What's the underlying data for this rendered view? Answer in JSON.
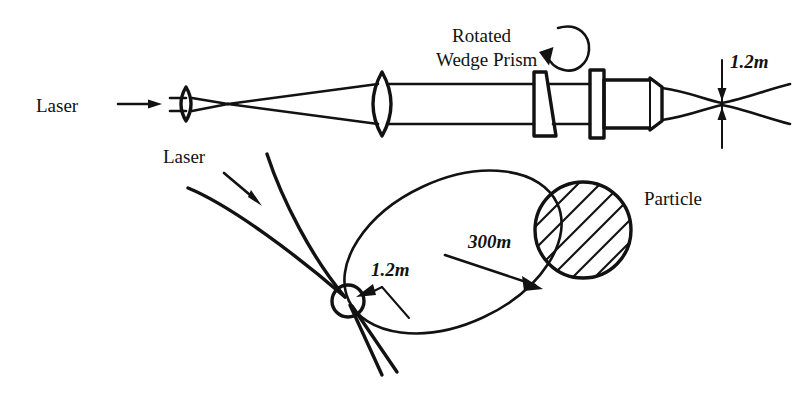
{
  "figure": {
    "title_present": false,
    "background_color": "#ffffff",
    "ink_color": "#121212",
    "width": 810,
    "height": 397
  },
  "top_diagram": {
    "name": "laser-beam-expander-optical-train",
    "source_label": "Laser",
    "prism_label_line1": "Rotated",
    "prism_label_line2": "Wedge Prism",
    "waist_label": "1.2m",
    "components": [
      {
        "name": "input-beam",
        "kind": "ray-pair"
      },
      {
        "name": "first-lens",
        "kind": "biconvex-lens"
      },
      {
        "name": "beam-focus",
        "kind": "crossover"
      },
      {
        "name": "second-lens",
        "kind": "biconvex-lens"
      },
      {
        "name": "wedge-prism",
        "kind": "wedge"
      },
      {
        "name": "flat-plate",
        "kind": "plate"
      },
      {
        "name": "telescope-tube",
        "kind": "tapered-barrel"
      },
      {
        "name": "output-waist",
        "kind": "beam-waist"
      }
    ],
    "rotation_indicator": "circular-rotation-arrow"
  },
  "bottom_diagram": {
    "name": "scan-pattern-and-particle",
    "source_label": "Laser",
    "waist_label": "1.2m",
    "scan_diameter_label": "300m",
    "particle_label": "Particle",
    "elements": [
      {
        "name": "incoming-laser-rays",
        "kind": "ray-pair"
      },
      {
        "name": "focal-spot",
        "kind": "small-circle"
      },
      {
        "name": "scan-ellipse",
        "kind": "tilted-ellipse"
      },
      {
        "name": "particle-disc",
        "kind": "hatched-circle"
      }
    ]
  }
}
